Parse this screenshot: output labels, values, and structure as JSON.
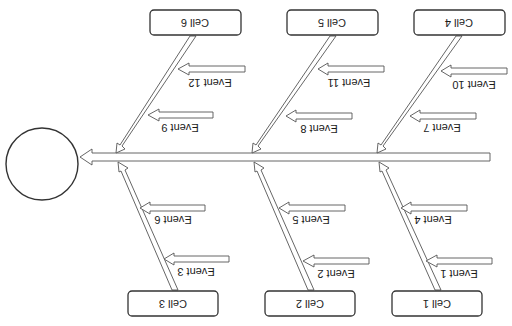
{
  "diagram": {
    "type": "fishbone",
    "orientation": "rotated-180",
    "head": {
      "label": ""
    },
    "cells": [
      {
        "id": 1,
        "label": "Cell 1",
        "events": [
          "Event 1",
          "Event 4"
        ]
      },
      {
        "id": 2,
        "label": "Cell 2",
        "events": [
          "Event 2",
          "Event 5"
        ]
      },
      {
        "id": 3,
        "label": "Cell 3",
        "events": [
          "Event 3",
          "Event 6"
        ]
      },
      {
        "id": 4,
        "label": "Cell 4",
        "events": [
          "Event 7",
          "Event 10"
        ]
      },
      {
        "id": 5,
        "label": "Cell 5",
        "events": [
          "Event 8",
          "Event 11"
        ]
      },
      {
        "id": 6,
        "label": "Cell 6",
        "events": [
          "Event 9",
          "Event 12"
        ]
      }
    ]
  },
  "labels": {
    "cell1": "Cell 1",
    "cell2": "Cell 2",
    "cell3": "Cell 3",
    "cell4": "Cell 4",
    "cell5": "Cell 5",
    "cell6": "Cell 6",
    "event1": "Event 1",
    "event2": "Event 2",
    "event3": "Event 3",
    "event4": "Event 4",
    "event5": "Event 5",
    "event6": "Event 6",
    "event7": "Event 7",
    "event8": "Event 8",
    "event9": "Event 9",
    "event10": "Event 10",
    "event11": "Event 11",
    "event12": "Event 12"
  },
  "colors": {
    "stroke": "#555555",
    "box_stroke": "#333333",
    "background": "#ffffff"
  }
}
